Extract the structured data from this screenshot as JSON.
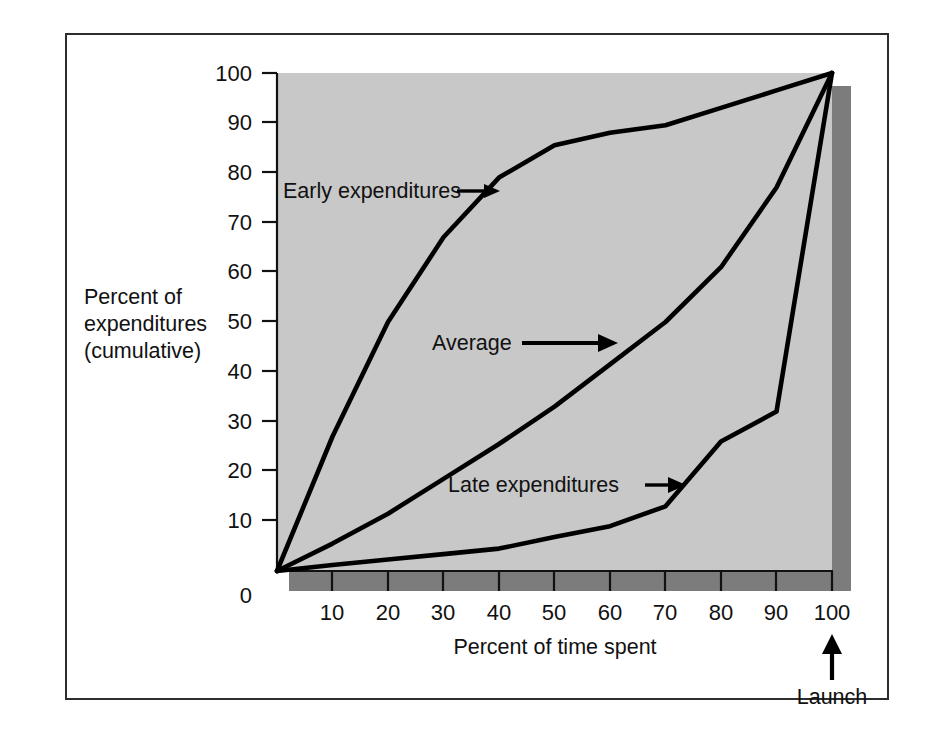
{
  "figure": {
    "frame_border_color": "#2d2d2d",
    "page_background": "#ffffff",
    "plot_background": "#c8c8c8",
    "shadow_color": "#7c7c7c",
    "line_color": "#000000"
  },
  "axes": {
    "y_axis_title_line1": "Percent of",
    "y_axis_title_line2": "expenditures",
    "y_axis_title_line3": "(cumulative)",
    "x_axis_title": "Percent of time spent",
    "y_ticks": [
      "0",
      "10",
      "20",
      "30",
      "40",
      "50",
      "60",
      "70",
      "80",
      "90",
      "100"
    ],
    "x_ticks": [
      "10",
      "20",
      "30",
      "40",
      "50",
      "60",
      "70",
      "80",
      "90",
      "100"
    ],
    "x_origin_label": "0"
  },
  "annotations": {
    "early_label": "Early expenditures",
    "average_label": "Average",
    "late_label": "Late expenditures",
    "launch_label": "Launch",
    "launch_marker": "up-arrow"
  },
  "chart_data": {
    "type": "line",
    "title": "",
    "xlabel": "Percent of time spent",
    "ylabel": "Percent of expenditures (cumulative)",
    "xlim": [
      0,
      100
    ],
    "ylim": [
      0,
      100
    ],
    "grid": false,
    "legend": "inline-annotations",
    "x": [
      0,
      10,
      20,
      30,
      40,
      50,
      60,
      70,
      80,
      90,
      100
    ],
    "series": [
      {
        "name": "Early expenditures",
        "values": [
          0,
          27,
          50,
          67,
          79,
          85.5,
          88,
          89.5,
          93,
          96.5,
          100
        ]
      },
      {
        "name": "Average",
        "values": [
          0,
          5.5,
          11.5,
          18.5,
          25.5,
          33,
          41.5,
          50,
          61,
          77,
          100
        ]
      },
      {
        "name": "Late expenditures",
        "values": [
          0,
          1.2,
          2.3,
          3.4,
          4.5,
          6.8,
          9,
          13,
          26,
          32,
          100
        ]
      }
    ],
    "annotations": [
      {
        "text": "Early expenditures",
        "points_to_series": "Early expenditures"
      },
      {
        "text": "Average",
        "points_to_series": "Average"
      },
      {
        "text": "Late expenditures",
        "points_to_series": "Late expenditures"
      },
      {
        "text": "Launch",
        "at_x": 100
      }
    ]
  }
}
